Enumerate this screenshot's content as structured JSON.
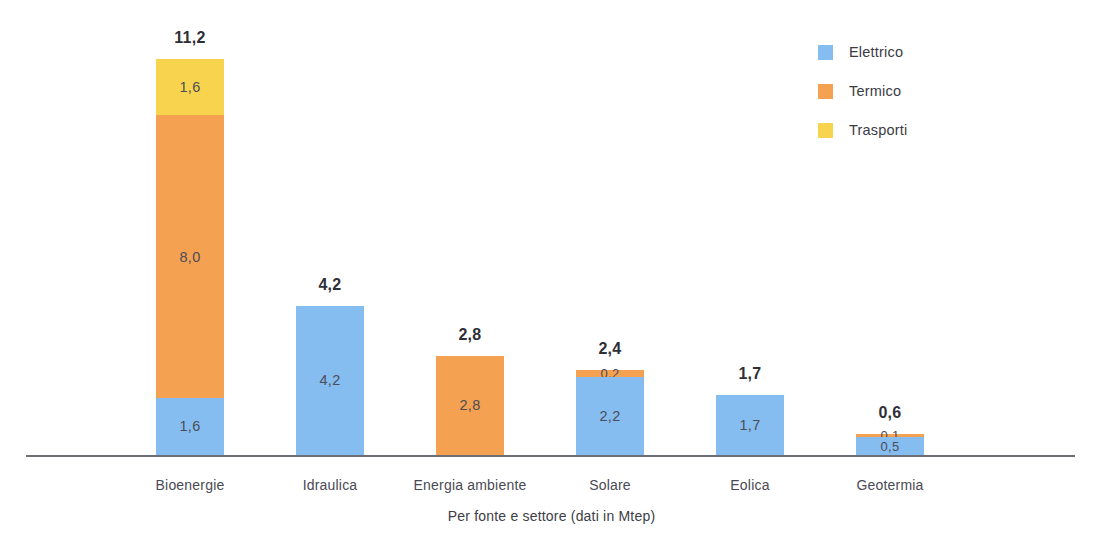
{
  "chart_data": {
    "type": "bar",
    "subtype": "stacked-vertical",
    "title": "",
    "caption": "Per fonte e settore (dati in Mtep)",
    "xlabel": "Per fonte e settore (dati in Mtep)",
    "ylabel": "",
    "unit": "Mtep",
    "ylim": [
      0,
      11.2
    ],
    "grid": false,
    "legend_position": "top-right",
    "decimal_separator": ",",
    "categories": [
      "Bioenergie",
      "Idraulica",
      "Energia ambiente",
      "Solare",
      "Eolica",
      "Geotermia"
    ],
    "series": [
      {
        "name": "Elettrico",
        "color": "#85bdf0",
        "values": [
          1.6,
          4.2,
          0,
          2.2,
          1.7,
          0.5
        ]
      },
      {
        "name": "Termico",
        "color": "#f4a152",
        "values": [
          8.0,
          0,
          2.8,
          0.2,
          0,
          0.1
        ]
      },
      {
        "name": "Trasporti",
        "color": "#f7d34e",
        "values": [
          1.6,
          0,
          0,
          0,
          0,
          0
        ]
      }
    ],
    "totals": [
      11.2,
      4.2,
      2.8,
      2.4,
      1.7,
      0.6
    ],
    "totals_display": [
      "11,2",
      "4,2",
      "2,8",
      "2,4",
      "1,7",
      "0,6"
    ],
    "bars": [
      {
        "category": "Bioenergie",
        "total_display": "11,2",
        "segments": [
          {
            "series": "Trasporti",
            "value": 1.6,
            "display": "1,6",
            "color": "#f7d34e"
          },
          {
            "series": "Termico",
            "value": 8.0,
            "display": "8,0",
            "color": "#f4a152"
          },
          {
            "series": "Elettrico",
            "value": 1.6,
            "display": "1,6",
            "color": "#85bdf0"
          }
        ]
      },
      {
        "category": "Idraulica",
        "total_display": "4,2",
        "segments": [
          {
            "series": "Elettrico",
            "value": 4.2,
            "display": "4,2",
            "color": "#85bdf0"
          }
        ]
      },
      {
        "category": "Energia ambiente",
        "total_display": "2,8",
        "segments": [
          {
            "series": "Termico",
            "value": 2.8,
            "display": "2,8",
            "color": "#f4a152"
          }
        ]
      },
      {
        "category": "Solare",
        "total_display": "2,4",
        "segments": [
          {
            "series": "Termico",
            "value": 0.2,
            "display": "0,2",
            "color": "#f4a152"
          },
          {
            "series": "Elettrico",
            "value": 2.2,
            "display": "2,2",
            "color": "#85bdf0"
          }
        ]
      },
      {
        "category": "Eolica",
        "total_display": "1,7",
        "segments": [
          {
            "series": "Elettrico",
            "value": 1.7,
            "display": "1,7",
            "color": "#85bdf0"
          }
        ]
      },
      {
        "category": "Geotermia",
        "total_display": "0,6",
        "segments": [
          {
            "series": "Termico",
            "value": 0.1,
            "display": "0,1",
            "color": "#f4a152"
          },
          {
            "series": "Elettrico",
            "value": 0.5,
            "display": "0,5",
            "color": "#85bdf0"
          }
        ]
      }
    ],
    "legend": [
      {
        "label": "Elettrico",
        "color": "#85bdf0"
      },
      {
        "label": "Termico",
        "color": "#f4a152"
      },
      {
        "label": "Trasporti",
        "color": "#f7d34e"
      }
    ]
  },
  "layout": {
    "baseline_y": 455,
    "px_per_unit": 35.4,
    "bar_width": 68,
    "bar_centers": [
      190,
      330,
      470,
      610,
      750,
      890
    ]
  }
}
